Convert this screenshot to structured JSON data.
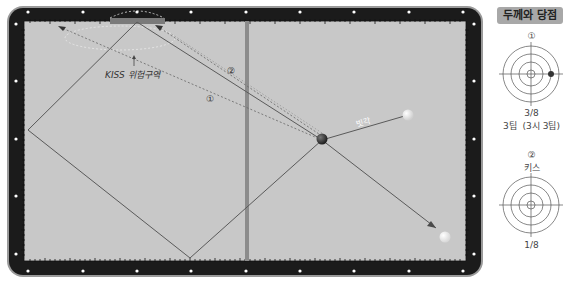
{
  "header": {
    "cut_off_text": "· · · · · · · · · · · · · · ·"
  },
  "table": {
    "annotations": {
      "kiss_zone": "KISS 위험구역",
      "path_1": "①",
      "path_2": "②",
      "oblique_label": "빗각"
    },
    "colors": {
      "rail": "#1a1a1a",
      "cloth": "#c9c9c9",
      "line": "#5a5a5a",
      "center_bar": "#8c8c8c",
      "object_ball_red": "#3a3a3a",
      "cue_ball_white": "#f2f2f2",
      "ball_yellow": "#e8e8e8",
      "diamond": "#ffffff"
    }
  },
  "panel": {
    "title": "두께와 당점",
    "diagram1": {
      "number": "①",
      "thickness": "3/8",
      "tip": "3팁",
      "tip_detail": "(3시 3팁)"
    },
    "diagram2": {
      "number": "②",
      "caption": "키스",
      "thickness": "1/8"
    }
  }
}
